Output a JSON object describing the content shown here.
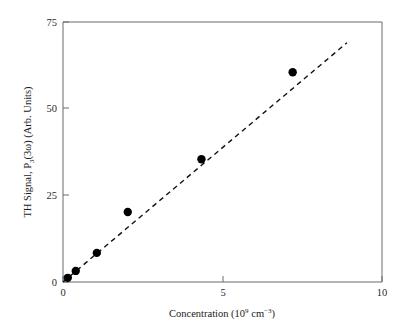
{
  "chart_data": {
    "type": "scatter",
    "title": "",
    "xlabel": "Concentration (10⁹ cm⁻³)",
    "ylabel": "TH Signal, P₃(3ω) (Arb. Units)",
    "xlim": [
      0,
      10
    ],
    "ylim": [
      0,
      75
    ],
    "grid": false,
    "legend": "none",
    "x_ticks": [
      {
        "value": 0,
        "label": "0"
      },
      {
        "value": 5,
        "label": "5"
      },
      {
        "value": 10,
        "label": "10"
      }
    ],
    "y_ticks": [
      {
        "value": 0,
        "label": "0"
      },
      {
        "value": 25,
        "label": "25"
      },
      {
        "value": 50,
        "label": "50"
      },
      {
        "value": 75,
        "label": "75"
      }
    ],
    "x": [
      0.15,
      0.4,
      1.06,
      2.03,
      4.34,
      7.2
    ],
    "y": [
      1.2,
      3.2,
      8.4,
      20.2,
      35.4,
      60.5
    ],
    "series": [
      {
        "name": "TH Signal",
        "marker": "filled-circle",
        "marker_color": "#000000",
        "marker_size": 7,
        "points": [
          {
            "x": 0.15,
            "y": 1.2
          },
          {
            "x": 0.4,
            "y": 3.2
          },
          {
            "x": 1.06,
            "y": 8.4
          },
          {
            "x": 2.03,
            "y": 20.2
          },
          {
            "x": 4.34,
            "y": 35.4
          },
          {
            "x": 7.2,
            "y": 60.5
          }
        ]
      }
    ],
    "fit_line": {
      "name": "linear fit",
      "style": "dashed",
      "color": "#111111",
      "x_start": 0.0,
      "y_start": 0.0,
      "x_end": 8.9,
      "y_end": 69.0,
      "slope": 7.75,
      "intercept": 0.0
    }
  },
  "axis_labels": {
    "x_title_main": "Concentration (10",
    "x_title_exp1": "9",
    "x_title_mid": " cm",
    "x_title_exp2": "−3",
    "x_title_close": ")",
    "y_title_part1": "TH Signal, P",
    "y_title_sub": "3",
    "y_title_part2": "(3ω) (Arb. Units)"
  },
  "colors": {
    "axis": "#5a5a5a",
    "marker": "#000000",
    "fit": "#111111",
    "background": "#ffffff",
    "text": "#1a1a1a"
  }
}
